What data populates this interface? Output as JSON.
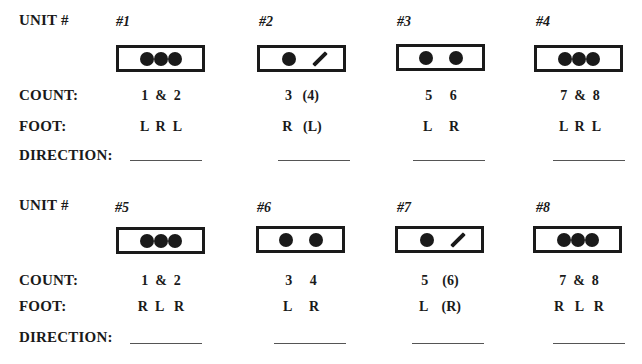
{
  "labels": {
    "unit": "UNIT #",
    "count": "COUNT:",
    "foot": "FOOT:",
    "direction": "DIRECTION:"
  },
  "rows": [
    {
      "units": [
        {
          "number": "#1",
          "pattern": "three-dots",
          "count": "1  &  2",
          "foot": "L  R  L"
        },
        {
          "number": "#2",
          "pattern": "dot-slash",
          "count": "3   (4)",
          "foot": "R   (L)"
        },
        {
          "number": "#3",
          "pattern": "two-dots",
          "count": "5     6",
          "foot": "L     R"
        },
        {
          "number": "#4",
          "pattern": "three-dots",
          "count": "7  &  8",
          "foot": "L  R  L"
        }
      ]
    },
    {
      "units": [
        {
          "number": "#5",
          "pattern": "three-dots",
          "count": "1  &  2",
          "foot": "R  L   R"
        },
        {
          "number": "#6",
          "pattern": "two-dots",
          "count": "3     4",
          "foot": "L     R"
        },
        {
          "number": "#7",
          "pattern": "dot-slash",
          "count": "5    (6)",
          "foot": "L    (R)"
        },
        {
          "number": "#8",
          "pattern": "three-dots",
          "count": "7  &  8",
          "foot": "R   L   R"
        }
      ]
    }
  ]
}
